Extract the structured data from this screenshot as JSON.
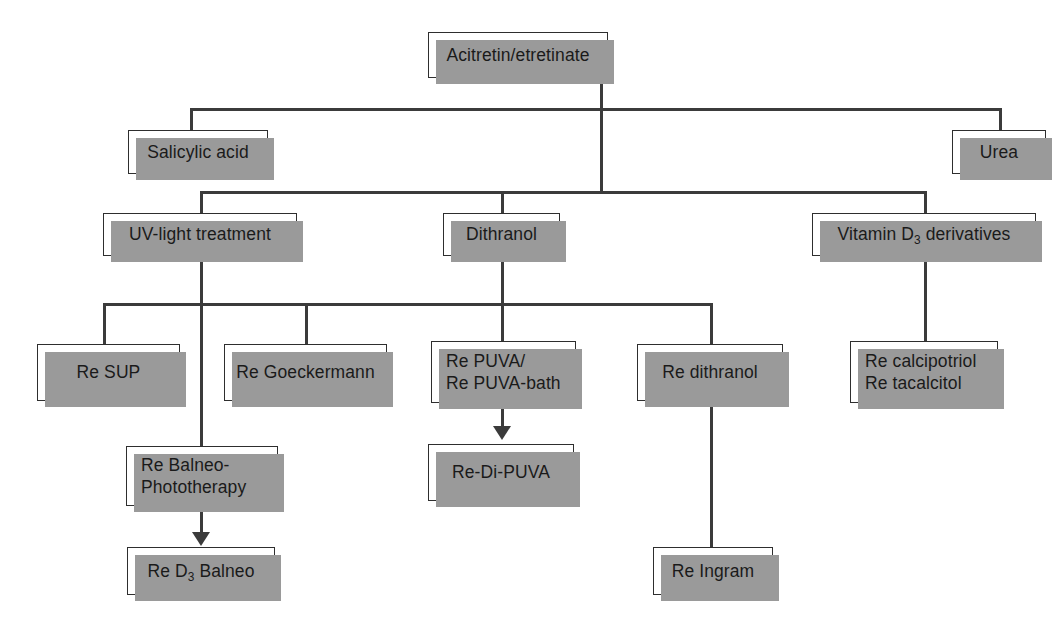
{
  "diagram": {
    "type": "tree-flowchart",
    "colors": {
      "box_border": "#2e2e2e",
      "box_fill": "#ffffff",
      "shadow": "#9a9a9a",
      "connector": "#3b3b3b",
      "text": "#1a1a1a",
      "background": "#ffffff"
    },
    "nodes": [
      {
        "id": "acitretin",
        "text": "Acitretin/etretinate",
        "align": "center",
        "level": 1
      },
      {
        "id": "salicylic",
        "text": "Salicylic acid",
        "align": "center",
        "level": 2
      },
      {
        "id": "urea",
        "text": "Urea",
        "align": "center",
        "level": 2
      },
      {
        "id": "uvlight",
        "text": "UV-light treatment",
        "align": "center",
        "level": 3
      },
      {
        "id": "dithranol",
        "text": "Dithranol",
        "align": "center",
        "level": 3
      },
      {
        "id": "vitd3",
        "text": "Vitamin D",
        "suffix": " derivatives",
        "subscript": "3",
        "align": "center",
        "level": 3
      },
      {
        "id": "resup",
        "text": "Re SUP",
        "align": "center",
        "level": 4
      },
      {
        "id": "regoeckermann",
        "text": "Re Goeckermann",
        "align": "center",
        "level": 4
      },
      {
        "id": "repuva",
        "text": "Re PUVA/\nRe PUVA-bath",
        "align": "left",
        "level": 4
      },
      {
        "id": "redithranol",
        "text": "Re dithranol",
        "align": "center",
        "level": 4
      },
      {
        "id": "recalci",
        "text": "Re calcipotriol\nRe tacalcitol",
        "align": "left",
        "level": 4
      },
      {
        "id": "rebalneo",
        "text": "Re Balneo-\nPhototherapy",
        "align": "left",
        "level": 5
      },
      {
        "id": "redipuva",
        "text": "Re-Di-PUVA",
        "align": "center",
        "level": 5
      },
      {
        "id": "red3balneo",
        "text": "Re D",
        "suffix": " Balneo",
        "subscript": "3",
        "align": "center",
        "level": 6
      },
      {
        "id": "reingram",
        "text": "Re Ingram",
        "align": "center",
        "level": 6
      }
    ],
    "edges": [
      {
        "from": "acitretin",
        "to": "salicylic",
        "style": "elbow"
      },
      {
        "from": "acitretin",
        "to": "urea",
        "style": "elbow"
      },
      {
        "from": "acitretin",
        "to": "uvlight",
        "style": "elbow"
      },
      {
        "from": "acitretin",
        "to": "dithranol",
        "style": "elbow"
      },
      {
        "from": "acitretin",
        "to": "vitd3",
        "style": "elbow"
      },
      {
        "from": "uvlight",
        "to": "resup",
        "style": "elbow"
      },
      {
        "from": "uvlight",
        "to": "regoeckermann",
        "style": "elbow"
      },
      {
        "from": "uvlight",
        "to": "rebalneo",
        "style": "straight"
      },
      {
        "from": "dithranol",
        "to": "repuva",
        "style": "straight"
      },
      {
        "from": "dithranol",
        "to": "redithranol",
        "style": "elbow"
      },
      {
        "from": "vitd3",
        "to": "recalci",
        "style": "straight"
      },
      {
        "from": "rebalneo",
        "to": "red3balneo",
        "style": "arrow"
      },
      {
        "from": "repuva",
        "to": "redipuva",
        "style": "arrow"
      },
      {
        "from": "redithranol",
        "to": "reingram",
        "style": "straight"
      }
    ]
  }
}
